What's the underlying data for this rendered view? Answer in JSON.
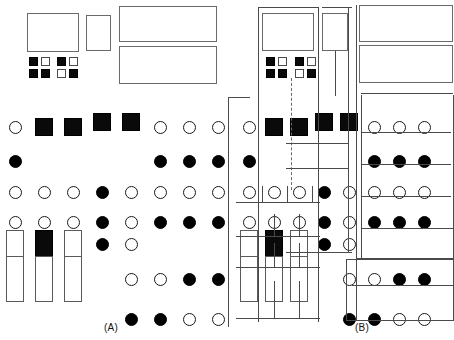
{
  "figure": {
    "caption_a": "(A)",
    "caption_b": "(B)",
    "colors": {
      "filled": "#000000",
      "open": "#ffffff",
      "stroke": "#4a4a4a",
      "line": "#4a4a4a",
      "background": "#ffffff"
    }
  },
  "panel_a": {
    "label": "(A)",
    "boxes": [
      {
        "name": "box-large-1",
        "shape": "rectangle",
        "fill": "open",
        "x": 27,
        "y": 13,
        "w": 52,
        "h": 39
      },
      {
        "name": "box-small-1",
        "shape": "rectangle",
        "fill": "open",
        "x": 86,
        "y": 15,
        "w": 25,
        "h": 36
      },
      {
        "name": "box-wide-1",
        "shape": "rectangle",
        "fill": "open",
        "x": 119,
        "y": 6,
        "w": 98,
        "h": 36
      },
      {
        "name": "box-wide-2",
        "shape": "rectangle",
        "fill": "open",
        "x": 119,
        "y": 46,
        "w": 98,
        "h": 38
      }
    ],
    "square_clusters": [
      {
        "name": "cluster-1",
        "x": 29,
        "y": 57,
        "cells": [
          "filled",
          "open",
          "filled",
          "filled"
        ]
      },
      {
        "name": "cluster-2",
        "x": 57,
        "y": 57,
        "cells": [
          "filled",
          "open",
          "open",
          "filled"
        ]
      }
    ],
    "rows": [
      {
        "name": "row-1",
        "y": 121,
        "items": [
          {
            "col": 1,
            "shape": "circle",
            "fill": "open"
          },
          {
            "col": 2,
            "shape": "square",
            "fill": "filled",
            "offset_y": 3
          },
          {
            "col": 3,
            "shape": "square",
            "fill": "filled",
            "offset_y": 3
          },
          {
            "col": 4,
            "shape": "square",
            "fill": "filled",
            "offset_y": -2
          },
          {
            "col": 5,
            "shape": "square",
            "fill": "filled",
            "offset_y": -2
          },
          {
            "col": 6,
            "shape": "circle",
            "fill": "open"
          },
          {
            "col": 7,
            "shape": "circle",
            "fill": "open"
          },
          {
            "col": 8,
            "shape": "circle",
            "fill": "open"
          }
        ]
      },
      {
        "name": "row-2",
        "y": 155,
        "items": [
          {
            "col": 1,
            "shape": "circle",
            "fill": "filled"
          },
          {
            "col": 6,
            "shape": "circle",
            "fill": "filled"
          },
          {
            "col": 7,
            "shape": "circle",
            "fill": "filled"
          },
          {
            "col": 8,
            "shape": "circle",
            "fill": "filled"
          }
        ]
      },
      {
        "name": "row-3",
        "y": 186,
        "items": [
          {
            "col": 1,
            "shape": "circle",
            "fill": "open"
          },
          {
            "col": 2,
            "shape": "circle",
            "fill": "open"
          },
          {
            "col": 3,
            "shape": "circle",
            "fill": "open"
          },
          {
            "col": 4,
            "shape": "circle",
            "fill": "filled"
          },
          {
            "col": 5,
            "shape": "circle",
            "fill": "open"
          },
          {
            "col": 6,
            "shape": "circle",
            "fill": "open"
          },
          {
            "col": 7,
            "shape": "circle",
            "fill": "open"
          },
          {
            "col": 8,
            "shape": "circle",
            "fill": "open"
          }
        ]
      },
      {
        "name": "row-4",
        "y": 216,
        "items": [
          {
            "col": 1,
            "shape": "circle",
            "fill": "open"
          },
          {
            "col": 2,
            "shape": "circle",
            "fill": "open"
          },
          {
            "col": 3,
            "shape": "circle",
            "fill": "open"
          },
          {
            "col": 4,
            "shape": "circle",
            "fill": "filled"
          },
          {
            "col": 5,
            "shape": "circle",
            "fill": "open"
          },
          {
            "col": 6,
            "shape": "circle",
            "fill": "filled"
          },
          {
            "col": 7,
            "shape": "circle",
            "fill": "filled"
          },
          {
            "col": 8,
            "shape": "circle",
            "fill": "filled"
          }
        ]
      },
      {
        "name": "row-5",
        "y": 247,
        "items": [
          {
            "col": 1,
            "shape": "rect",
            "fill": "open"
          },
          {
            "col": 2,
            "shape": "rect",
            "fill": "filled"
          },
          {
            "col": 3,
            "shape": "rect",
            "fill": "open"
          },
          {
            "col": 4,
            "shape": "circle",
            "fill": "filled",
            "offset_y": -9
          },
          {
            "col": 5,
            "shape": "circle",
            "fill": "open",
            "offset_y": -9
          }
        ]
      },
      {
        "name": "row-6",
        "y": 285,
        "items": [
          {
            "col": 1,
            "shape": "tallrect",
            "fill": "open"
          },
          {
            "col": 2,
            "shape": "tallrect",
            "fill": "open"
          },
          {
            "col": 3,
            "shape": "tallrect",
            "fill": "open"
          },
          {
            "col": 5,
            "shape": "circle",
            "fill": "open",
            "offset_y": -12
          },
          {
            "col": 6,
            "shape": "circle",
            "fill": "open",
            "offset_y": -12
          },
          {
            "col": 7,
            "shape": "circle",
            "fill": "filled",
            "offset_y": -12
          },
          {
            "col": 8,
            "shape": "circle",
            "fill": "filled",
            "offset_y": -12
          }
        ]
      },
      {
        "name": "row-7",
        "y": 313,
        "items": [
          {
            "col": 5,
            "shape": "circle",
            "fill": "filled"
          },
          {
            "col": 6,
            "shape": "circle",
            "fill": "filled"
          },
          {
            "col": 7,
            "shape": "circle",
            "fill": "open"
          },
          {
            "col": 8,
            "shape": "circle",
            "fill": "open"
          }
        ]
      }
    ]
  },
  "panel_b": {
    "label": "(B)",
    "description": "same shape layout as panel A with hierarchical grouping lines added",
    "boxes": [
      {
        "name": "box-large-1",
        "shape": "rectangle",
        "fill": "open",
        "x": 262,
        "y": 13,
        "w": 52,
        "h": 38
      },
      {
        "name": "box-small-1",
        "shape": "rectangle",
        "fill": "open",
        "x": 322,
        "y": 13,
        "w": 26,
        "h": 38
      },
      {
        "name": "box-wide-1",
        "shape": "rectangle",
        "fill": "open",
        "x": 359,
        "y": 5,
        "w": 94,
        "h": 37
      },
      {
        "name": "box-wide-2",
        "shape": "rectangle",
        "fill": "open",
        "x": 359,
        "y": 45,
        "w": 94,
        "h": 38
      }
    ],
    "square_clusters": [
      {
        "name": "cluster-1",
        "x": 266,
        "y": 57,
        "cells": [
          "filled",
          "open",
          "filled",
          "filled"
        ]
      },
      {
        "name": "cluster-2",
        "x": 295,
        "y": 57,
        "cells": [
          "filled",
          "open",
          "open",
          "filled"
        ]
      }
    ],
    "group_lines_count": 26
  }
}
